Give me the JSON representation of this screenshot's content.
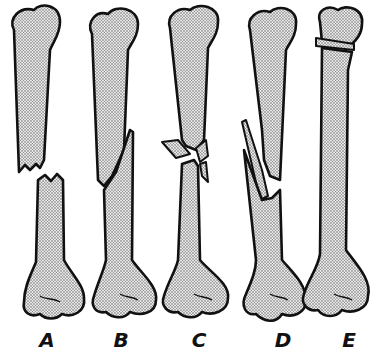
{
  "figure": {
    "panels": [
      {
        "label": "A",
        "x": 47
      },
      {
        "label": "B",
        "x": 120
      },
      {
        "label": "C",
        "x": 198
      },
      {
        "label": "D",
        "x": 282
      },
      {
        "label": "E",
        "x": 349
      }
    ],
    "colors": {
      "outline": "#111111",
      "fill": "#d9d9d9",
      "background": "#ffffff"
    }
  }
}
